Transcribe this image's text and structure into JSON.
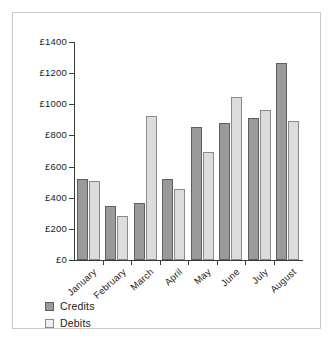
{
  "figure": {
    "border_color": "#c9c9c9",
    "background": "#ffffff"
  },
  "legend": {
    "position": "bottom-left",
    "items": [
      {
        "label": "Credits",
        "color": "#9a9a9a"
      },
      {
        "label": "Debits",
        "color": "#e8e8e8"
      }
    ]
  },
  "chart_data": {
    "type": "bar",
    "title": "",
    "xlabel": "",
    "ylabel": "",
    "currency_symbol": "£",
    "categories": [
      "January",
      "February",
      "March",
      "April",
      "May",
      "June",
      "July",
      "August"
    ],
    "series": [
      {
        "name": "Credits",
        "color": "#9a9a9a",
        "values": [
          520,
          350,
          365,
          520,
          855,
          880,
          915,
          1265
        ]
      },
      {
        "name": "Debits",
        "color": "#dcdcdc",
        "values": [
          510,
          285,
          925,
          455,
          695,
          1045,
          965,
          895
        ]
      }
    ],
    "ylim": [
      0,
      1400
    ],
    "ytick_values": [
      0,
      200,
      400,
      600,
      800,
      1000,
      1200,
      1400
    ],
    "ytick_labels": [
      "£0",
      "£200",
      "£400",
      "£600",
      "£800",
      "£1000",
      "£1200",
      "£1400"
    ],
    "grid": false,
    "xtick_rotation": -42
  }
}
